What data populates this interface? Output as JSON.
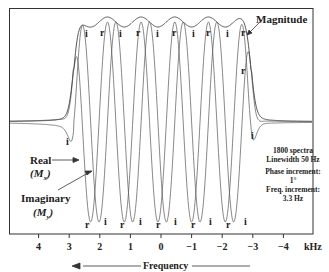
{
  "chart_data": {
    "type": "line",
    "title": "",
    "xlabel": "Frequency",
    "x_unit": "kHz",
    "x_ticks": [
      4,
      3,
      2,
      1,
      0,
      -1,
      -2,
      -3,
      -4
    ],
    "xlim": [
      4.9,
      -5.0
    ],
    "x_direction": "reversed (arrow points toward positive frequency)",
    "grid": false,
    "series": [
      {
        "name": "Magnitude",
        "description": "Envelope of absolute value; flat plateau from ~2.8 to ~-2.9 kHz with small ripples, steep edges, Lorentzian tails"
      },
      {
        "name": "Real (Mx)",
        "description": "Oscillating absorption-like signal across band; labeled r at extrema"
      },
      {
        "name": "Imaginary (My)",
        "description": "Oscillating dispersion-like signal across band, phase-shifted from real; labeled i at extrema"
      }
    ],
    "band_edges_khz": [
      2.85,
      -2.95
    ],
    "oscillation_period_khz": 1.1,
    "annotations": {
      "magnitude_label": "Magnitude",
      "real_label": "Real",
      "real_sub": "(Mx)",
      "imag_label": "Imaginary",
      "imag_sub": "(My)",
      "params": [
        "1800 spectra",
        "Linewidth 50 Hz",
        "Phase increment:",
        "1°",
        "Freq. increment:",
        "3.3 Hz"
      ]
    },
    "top_markers": [
      "i",
      "r",
      "i",
      "r",
      "i",
      "r",
      "i",
      "r",
      "i",
      "r",
      "i"
    ],
    "bottom_markers": [
      "r",
      "i",
      "r",
      "i",
      "r",
      "i",
      "r",
      "i",
      "r",
      "i"
    ],
    "edge_markers": {
      "left_i": "i",
      "right_r": "r",
      "right_i": "i"
    }
  },
  "labels": {
    "magnitude": "Magnitude",
    "real": "Real",
    "real_sub": "(M",
    "real_subscript": "x",
    "imag": "Imaginary",
    "imag_sub": "(M",
    "imag_subscript": "y",
    "close_paren": ")",
    "frequency": "Frequency",
    "unit": "kHz",
    "ticks": [
      "4",
      "3",
      "2",
      "1",
      "0",
      "−1",
      "−2",
      "−3",
      "−4"
    ],
    "note1": "1800 spectra",
    "note2": "Linewidth 50 Hz",
    "note3": "Phase increment:",
    "note4": "1°",
    "note5": "Freq. increment:",
    "note6": "3.3 Hz",
    "r": "r",
    "i": "i"
  },
  "colors": {
    "line": "#333333",
    "frame": "#333333",
    "text": "#222222"
  }
}
